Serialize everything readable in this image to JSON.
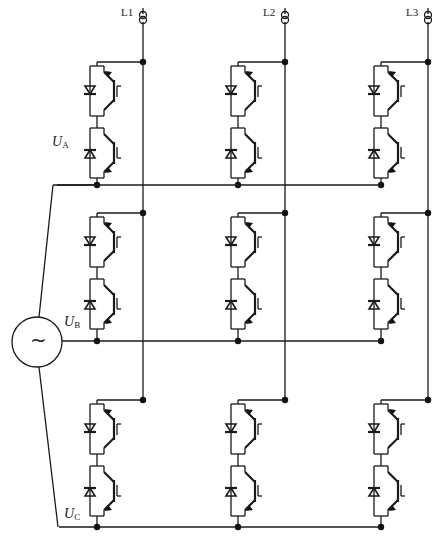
{
  "diagram": {
    "title": "",
    "type": "matrix-converter-circuit",
    "colors": {
      "line": "#1a1a1a",
      "background": "#ffffff"
    }
  },
  "outputs": [
    {
      "label": "L1",
      "x": 143,
      "icon": "current-sensor-icon"
    },
    {
      "label": "L2",
      "x": 285,
      "icon": "current-sensor-icon"
    },
    {
      "label": "L3",
      "x": 428,
      "icon": "current-sensor-icon"
    }
  ],
  "phases": [
    {
      "label": "U",
      "sub": "A",
      "row_top": 62,
      "bus_y": 185
    },
    {
      "label": "U",
      "sub": "B",
      "row_top": 213,
      "bus_y": 341
    },
    {
      "label": "U",
      "sub": "C",
      "row_top": 400,
      "bus_y": 527
    }
  ],
  "source": {
    "symbol": "~",
    "icon": "ac-source-icon",
    "cx": 37,
    "cy": 342,
    "r": 25
  },
  "switch_cell": {
    "upper": {
      "icon": "igbt-with-antiparallel-diode-icon",
      "gate_mark": "Γ"
    },
    "lower": {
      "icon": "igbt-with-antiparallel-diode-icon",
      "gate_mark": "L"
    }
  },
  "columns_x": [
    97,
    238,
    381
  ]
}
